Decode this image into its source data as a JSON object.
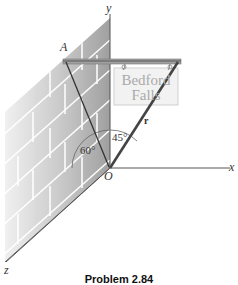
{
  "figure": {
    "caption": "Problem 2.84",
    "axes": {
      "x_label": "x",
      "y_label": "y",
      "z_label": "z",
      "origin_label": "O"
    },
    "point_labels": {
      "A": "A"
    },
    "vector_label": "r",
    "angles": {
      "angle_1": "60°",
      "angle_2": "45°"
    },
    "sign": {
      "line1": "Bedford",
      "line2": "Falls"
    },
    "colors": {
      "wall_light": "#e8e8e8",
      "wall_dark": "#a8a8a8",
      "brick_line": "#ffffff",
      "bar": "#9a9a9a",
      "cable": "#333333",
      "axis": "#555555",
      "sign_fill": "#f2f2f2",
      "sign_border": "#c8c8c8"
    }
  }
}
